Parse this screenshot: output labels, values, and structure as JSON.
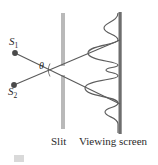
{
  "figure": {
    "labels": {
      "source_1": "S",
      "source_1_sub": "1",
      "source_2": "S",
      "source_2_sub": "2",
      "angle": "θ",
      "slit": "Slit",
      "screen": "Viewing screen"
    },
    "colors": {
      "ray": "#5a5a5a",
      "source_dot": "#4a4a4a",
      "slit_bar": "#b9b9b9",
      "screen_bar": "#6e6e6e",
      "intensity_curve": "#5e5e5e",
      "text": "#2b2b2b",
      "background": "#ffffff"
    },
    "geometry": {
      "source_1_point": [
        15,
        53
      ],
      "source_2_point": [
        14,
        85
      ],
      "slit_x": 63,
      "slit_gap_center_y": 70,
      "screen_x": 120,
      "ray_1_end": [
        120,
        103
      ],
      "ray_2_end": [
        120,
        40
      ],
      "angle_vertex": [
        63,
        70
      ]
    },
    "intensity_pattern": {
      "type": "line",
      "description": "Young double-slit interference intensity profile plotted horizontally against the viewing screen",
      "orientation": "vertical-axis-position, horizontal-axis-intensity",
      "peak_positions_y": [
        28,
        53,
        70,
        88,
        112
      ],
      "peak_amplitudes": [
        0.45,
        0.85,
        0.55,
        0.9,
        0.4
      ],
      "baseline_x": 120,
      "ylabel": "Position on screen",
      "xlabel": "Intensity"
    }
  }
}
